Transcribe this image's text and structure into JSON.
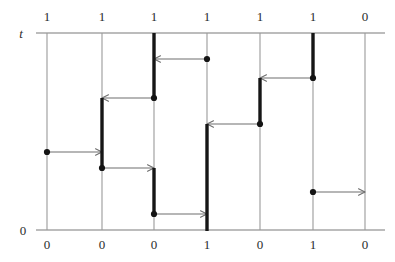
{
  "figure": {
    "type": "space-time-diagram",
    "axis_label_top": "t",
    "axis_label_bottom": "0",
    "width": 395,
    "height": 262,
    "colors": {
      "thin_line": "#9a9a9a",
      "axis": "#7a7a7a",
      "bold_segment": "#161616",
      "arrow": "#6e6e6e",
      "dot": "#141414",
      "background": "#ffffff",
      "text": "#2b2b2b"
    },
    "geometry": {
      "top_axis_y": 33,
      "bottom_axis_y": 230,
      "axis_x_start": 36,
      "axis_x_end": 385,
      "process_x": [
        47,
        102,
        154,
        207,
        260,
        313,
        365
      ]
    }
  },
  "top_labels": [
    {
      "text": "1",
      "x": 47
    },
    {
      "text": "1",
      "x": 102
    },
    {
      "text": "1",
      "x": 154
    },
    {
      "text": "1",
      "x": 207
    },
    {
      "text": "1",
      "x": 260
    },
    {
      "text": "1",
      "x": 313
    },
    {
      "text": "0",
      "x": 365
    }
  ],
  "bottom_labels": [
    {
      "text": "0",
      "x": 47
    },
    {
      "text": "0",
      "x": 102
    },
    {
      "text": "0",
      "x": 154
    },
    {
      "text": "1",
      "x": 207
    },
    {
      "text": "0",
      "x": 260
    },
    {
      "text": "1",
      "x": 313
    },
    {
      "text": "0",
      "x": 365
    }
  ],
  "process_lines": [
    {
      "name": "process-1",
      "x": 47,
      "y1": 33,
      "y2": 230
    },
    {
      "name": "process-2",
      "x": 102,
      "y1": 33,
      "y2": 230
    },
    {
      "name": "process-3",
      "x": 154,
      "y1": 33,
      "y2": 230
    },
    {
      "name": "process-4",
      "x": 207,
      "y1": 33,
      "y2": 230
    },
    {
      "name": "process-5",
      "x": 260,
      "y1": 33,
      "y2": 230
    },
    {
      "name": "process-6",
      "x": 313,
      "y1": 33,
      "y2": 230
    },
    {
      "name": "process-7",
      "x": 365,
      "y1": 33,
      "y2": 230
    }
  ],
  "bold_segments": [
    {
      "name": "bold-p3-upper",
      "x": 154,
      "y1": 33,
      "y2": 99
    },
    {
      "name": "bold-p2-mid",
      "x": 102,
      "y1": 98,
      "y2": 169
    },
    {
      "name": "bold-p3-lower",
      "x": 154,
      "y1": 168,
      "y2": 215
    },
    {
      "name": "bold-p4-bottom",
      "x": 207,
      "y1": 124,
      "y2": 231
    },
    {
      "name": "bold-p5-mid",
      "x": 260,
      "y1": 78,
      "y2": 125
    },
    {
      "name": "bold-p6-upper",
      "x": 313,
      "y1": 33,
      "y2": 79
    }
  ],
  "event_dots": [
    {
      "name": "dot-p4-t59",
      "x": 207,
      "y": 59
    },
    {
      "name": "dot-p3-t98",
      "x": 154,
      "y": 98
    },
    {
      "name": "dot-p1-t152",
      "x": 47,
      "y": 152
    },
    {
      "name": "dot-p2-t168",
      "x": 102,
      "y": 168
    },
    {
      "name": "dot-p3-t214",
      "x": 154,
      "y": 214
    },
    {
      "name": "dot-p5-t124",
      "x": 260,
      "y": 124
    },
    {
      "name": "dot-p6-t78",
      "x": 313,
      "y": 78
    },
    {
      "name": "dot-p6-t192",
      "x": 313,
      "y": 192
    }
  ],
  "messages": [
    {
      "name": "msg-p4-to-p3",
      "from_x": 207,
      "to_x": 154,
      "y": 59,
      "direction": "left"
    },
    {
      "name": "msg-p3-to-p2",
      "from_x": 154,
      "to_x": 102,
      "y": 98,
      "direction": "left"
    },
    {
      "name": "msg-p1-to-p2",
      "from_x": 47,
      "to_x": 102,
      "y": 152,
      "direction": "right"
    },
    {
      "name": "msg-p2-to-p3",
      "from_x": 102,
      "to_x": 154,
      "y": 168,
      "direction": "right"
    },
    {
      "name": "msg-p3-to-p4",
      "from_x": 154,
      "to_x": 207,
      "y": 214,
      "direction": "right"
    },
    {
      "name": "msg-p5-to-p4",
      "from_x": 260,
      "to_x": 207,
      "y": 124,
      "direction": "left"
    },
    {
      "name": "msg-p6-to-p5",
      "from_x": 313,
      "to_x": 260,
      "y": 78,
      "direction": "left"
    },
    {
      "name": "msg-p6-to-p7",
      "from_x": 313,
      "to_x": 365,
      "y": 192,
      "direction": "right"
    }
  ]
}
